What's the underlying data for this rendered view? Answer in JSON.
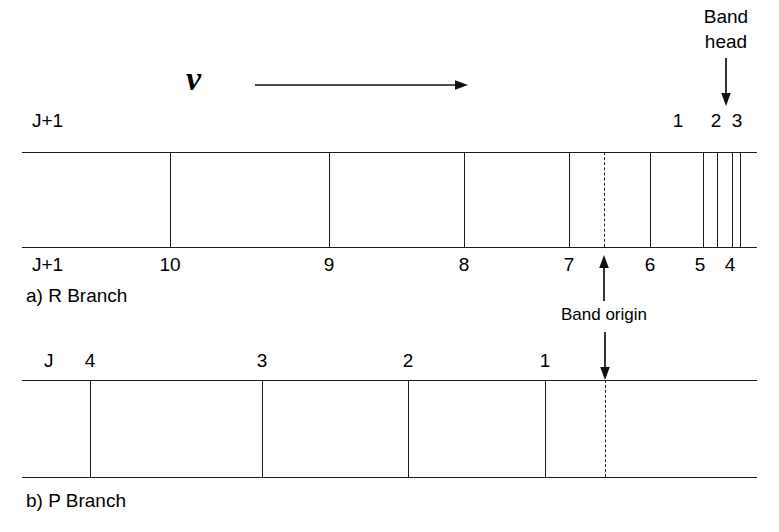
{
  "figure": {
    "title_hidden": "",
    "axis_symbol": "ν",
    "band_head_label_line1": "Band",
    "band_head_label_line2": "head",
    "band_origin_label": "Band origin",
    "left_label_top": "J+1",
    "left_label_bottom": "J+1",
    "p_left_label": "J",
    "caption_a": "a) R Branch",
    "caption_b": "b) P Branch"
  },
  "r_branch": {
    "name": "R Branch",
    "box": {
      "x": 22,
      "y": 152,
      "width": 735,
      "height": 95
    },
    "band_origin_x": 604,
    "lines": [
      {
        "label": "10",
        "x": 170,
        "label_side": "bottom"
      },
      {
        "label": "9",
        "x": 329,
        "label_side": "bottom"
      },
      {
        "label": "8",
        "x": 464,
        "label_side": "bottom"
      },
      {
        "label": "7",
        "x": 569,
        "label_side": "bottom"
      },
      {
        "label": "6",
        "x": 650,
        "label_side": "bottom"
      },
      {
        "label": "5",
        "x": 703,
        "label_side": "bottom"
      },
      {
        "label": "4",
        "x": 732,
        "label_side": "bottom"
      },
      {
        "label": "",
        "x": 740,
        "label_side": "none"
      }
    ],
    "top_numbers": [
      {
        "label": "1",
        "x": 678
      },
      {
        "label": "2",
        "x": 716
      },
      {
        "label": "3",
        "x": 737
      }
    ],
    "bottom_numbers": [
      {
        "label": "10",
        "x": 170
      },
      {
        "label": "9",
        "x": 329
      },
      {
        "label": "8",
        "x": 464
      },
      {
        "label": "7",
        "x": 569
      },
      {
        "label": "6",
        "x": 650
      },
      {
        "label": "5",
        "x": 700
      },
      {
        "label": "4",
        "x": 730
      }
    ]
  },
  "p_branch": {
    "name": "P Branch",
    "box": {
      "x": 22,
      "y": 380,
      "width": 735,
      "height": 97
    },
    "band_origin_x": 605,
    "lines": [
      {
        "label": "4",
        "x": 90
      },
      {
        "label": "3",
        "x": 262
      },
      {
        "label": "2",
        "x": 408
      },
      {
        "label": "1",
        "x": 545
      }
    ],
    "top_numbers": [
      {
        "label": "4",
        "x": 90
      },
      {
        "label": "3",
        "x": 262
      },
      {
        "label": "2",
        "x": 408
      },
      {
        "label": "1",
        "x": 545
      }
    ]
  },
  "colors": {
    "ink": "#1a1a1a",
    "background": "#ffffff",
    "dash": "#222222"
  }
}
